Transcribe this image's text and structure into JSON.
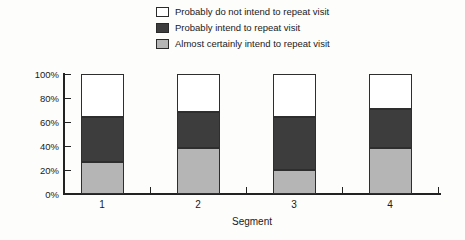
{
  "chart_data": {
    "type": "bar",
    "stacked": true,
    "title": "",
    "xlabel": "Segment",
    "ylabel": "",
    "categories": [
      "1",
      "2",
      "3",
      "4"
    ],
    "ylim": [
      0,
      100
    ],
    "ytick_labels": [
      "0%",
      "20%",
      "40%",
      "60%",
      "80%",
      "100%"
    ],
    "grid": false,
    "legend_position": "top-center",
    "legend_order_top_to_bottom": [
      "Probably do not intend to repeat visit",
      "Probably intend to repeat visit",
      "Almost certainly intend to repeat visit"
    ],
    "series": [
      {
        "name": "Almost certainly intend to repeat visit",
        "color": "#b5b5b5",
        "values": [
          27,
          38,
          20,
          38
        ]
      },
      {
        "name": "Probably intend to repeat visit",
        "color": "#3d3d3d",
        "values": [
          37,
          30,
          44,
          33
        ]
      },
      {
        "name": "Probably do not intend to repeat visit",
        "color": "#ffffff",
        "values": [
          36,
          32,
          36,
          29
        ]
      }
    ]
  },
  "colors": {
    "background": "#fdfdfc",
    "axis": "#222222",
    "text": "#1a1a1a",
    "segment_border": "#2e2e2e"
  }
}
